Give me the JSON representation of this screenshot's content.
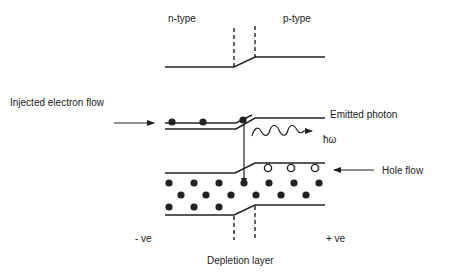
{
  "diagram": {
    "type": "p-n junction LED band diagram",
    "labels": {
      "n_type": "n-type",
      "p_type": "p-type",
      "injected_electron_flow": "Injected electron flow",
      "emitted_photon": "Emitted photon",
      "photon_energy": "ħω",
      "hole_flow": "Hole flow",
      "negative_terminal": "- ve",
      "positive_terminal": "+ ve",
      "depletion_layer": "Depletion layer"
    },
    "regions": [
      "n-type",
      "depletion layer",
      "p-type"
    ],
    "carriers": {
      "conduction_electrons_n_side": 3,
      "holes_p_side": 3,
      "valence_electrons_rows": [
        7,
        6,
        3
      ]
    },
    "colors": {
      "line": "#222222",
      "text": "#222222",
      "background": "#ffffff"
    }
  }
}
